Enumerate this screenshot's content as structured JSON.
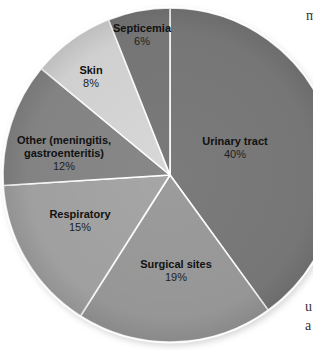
{
  "chart_data": {
    "type": "pie",
    "title": "",
    "start_angle_deg": 0,
    "direction": "clockwise",
    "categories": [
      "Urinary tract",
      "Surgical sites",
      "Respiratory",
      "Other (meningitis, gastroenteritis)",
      "Skin",
      "Septicemia"
    ],
    "values": [
      40,
      19,
      15,
      12,
      8,
      6
    ],
    "unit": "%",
    "slices": [
      {
        "label_lines": [
          "Urinary tract"
        ],
        "pct": "40%",
        "value": 40,
        "color": "#7b7b7b",
        "label_pos": [
          235,
          145
        ]
      },
      {
        "label_lines": [
          "Surgical sites"
        ],
        "pct": "19%",
        "value": 19,
        "color": "#9c9c9c",
        "label_pos": [
          176,
          268
        ]
      },
      {
        "label_lines": [
          "Respiratory"
        ],
        "pct": "15%",
        "value": 15,
        "color": "#a6a6a6",
        "label_pos": [
          80,
          218
        ]
      },
      {
        "label_lines": [
          "Other (meningitis,",
          "gastroenteritis)"
        ],
        "pct": "12%",
        "value": 12,
        "color": "#888888",
        "label_pos": [
          64,
          144
        ]
      },
      {
        "label_lines": [
          "Skin"
        ],
        "pct": "8%",
        "value": 8,
        "color": "#d8d8d8",
        "label_pos": [
          91,
          74
        ]
      },
      {
        "label_lines": [
          "Septicemia"
        ],
        "pct": "6%",
        "value": 6,
        "color": "#7a7a7a",
        "label_pos": [
          142,
          32
        ]
      }
    ],
    "center": [
      170,
      175
    ],
    "radius": 167,
    "legend": "none"
  },
  "side_text": [
    {
      "text": "m",
      "x": 306,
      "y": 22
    },
    {
      "text": "u",
      "x": 305,
      "y": 313
    },
    {
      "text": "a",
      "x": 305,
      "y": 332
    }
  ]
}
